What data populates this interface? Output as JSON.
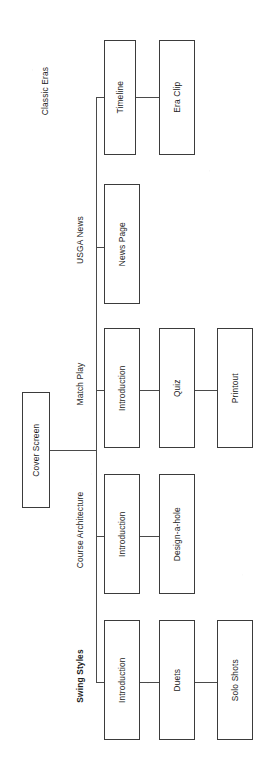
{
  "diagram": {
    "type": "tree-sitemap",
    "orientation": "rotated-90-ccw",
    "root": {
      "label": "Cover Screen"
    },
    "branches": [
      {
        "label": "Classic Eras",
        "bold": false,
        "nodes": [
          {
            "label": "Timeline"
          },
          {
            "label": "Era Clip"
          }
        ]
      },
      {
        "label": "USGA News",
        "bold": false,
        "nodes": [
          {
            "label": "News Page"
          }
        ]
      },
      {
        "label": "Match Play",
        "bold": false,
        "nodes": [
          {
            "label": "Introduction"
          },
          {
            "label": "Quiz"
          },
          {
            "label": "Printout"
          }
        ]
      },
      {
        "label": "Course Architecture",
        "bold": false,
        "nodes": [
          {
            "label": "Introduction"
          },
          {
            "label": "Design-a-hole"
          }
        ]
      },
      {
        "label": "Swing Styles",
        "bold": true,
        "nodes": [
          {
            "label": "Introduction"
          },
          {
            "label": "Duets"
          },
          {
            "label": "Solo Shots"
          }
        ]
      }
    ],
    "colors": {
      "background": "#ffffff",
      "box_border": "#3b3b3b",
      "connector": "#4a4a4a",
      "text": "#1c1c1c"
    }
  }
}
